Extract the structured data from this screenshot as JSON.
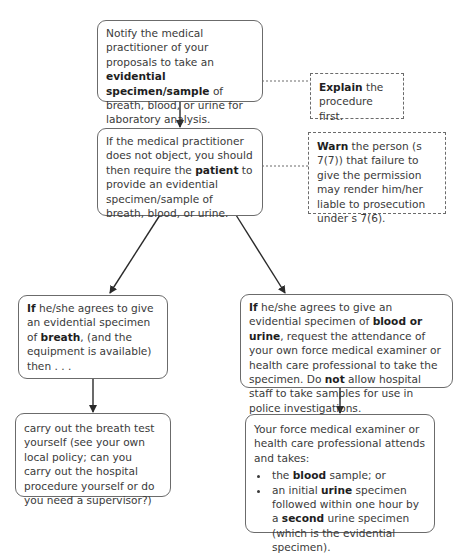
{
  "diagram": {
    "step1": {
      "pre": "Notify the medical practitioner of your proposals to take an ",
      "bold": "evidential specimen/sample",
      "post": " of breath, blood, or urine for laboratory analysis."
    },
    "note_explain": {
      "bold": "Explain",
      "post": " the procedure first."
    },
    "step2": {
      "pre": "If the medical practitioner does not object, you should then require the ",
      "bold": "patient",
      "post": " to provide an evidential specimen/sample of breath, blood, or urine."
    },
    "note_warn": {
      "bold": "Warn",
      "post": " the person (s 7(7)) that failure to give the permission may render him/her liable to prosecution under s 7(6)."
    },
    "branch_breath": {
      "bold1": "If",
      "mid": " he/she agrees to give an evidential specimen of ",
      "bold2": "breath",
      "post": ", (and the equipment is available) then . . ."
    },
    "branch_blood_urine": {
      "bold1": "If",
      "mid1": " he/she agrees to give an evidential specimen of ",
      "bold2": "blood or urine",
      "mid2": ", request the attendance of your own force medical examiner or health care professional to take the specimen. Do ",
      "bold3": "not",
      "post": " allow hospital staff to take samples for use in police investigations."
    },
    "outcome_breath": {
      "text": "carry out the breath test yourself (see your own local policy; can you carry out the hospital procedure yourself or do you need a supervisor?)"
    },
    "outcome_blood_urine": {
      "intro": "Your force medical examiner or health care professional attends and takes:",
      "bullets": [
        {
          "pre": "the ",
          "bold": "blood",
          "post": " sample; or"
        },
        {
          "pre": "an initial ",
          "bold": "urine",
          "mid": " specimen followed within one hour by a ",
          "bold2": "second",
          "post": " urine specimen (which is the evidential specimen)."
        }
      ]
    },
    "colors": {
      "border": "#6b6b6b",
      "text": "#3a3a3a",
      "arrow": "#2a2a2a"
    }
  }
}
